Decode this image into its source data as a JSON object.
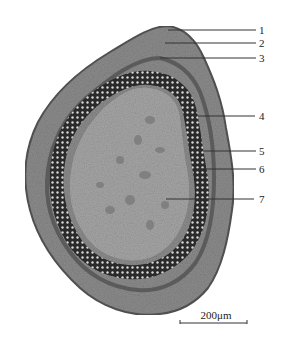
{
  "figure": {
    "labels": [
      {
        "id": "1",
        "text": "1",
        "y": 30
      },
      {
        "id": "2",
        "text": "2",
        "y": 43
      },
      {
        "id": "3",
        "text": "3",
        "y": 58
      },
      {
        "id": "4",
        "text": "4",
        "y": 116
      },
      {
        "id": "5",
        "text": "5",
        "y": 151
      },
      {
        "id": "6",
        "text": "6",
        "y": 169
      },
      {
        "id": "7",
        "text": "7",
        "y": 199
      }
    ],
    "scale_bar": {
      "text": "200μm"
    },
    "colors": {
      "background": "#ffffff",
      "cortex": "#8a8a8a",
      "vascular_ring": "#2e2e2e",
      "pith": "#a5a5a5",
      "leader_line": "#333333"
    }
  }
}
